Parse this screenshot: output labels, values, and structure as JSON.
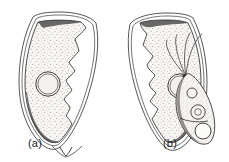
{
  "figure": {
    "kind": "scientific-line-drawing",
    "caption_labels": [
      {
        "id": "a",
        "text": "(a)",
        "x": 28,
        "y": 147
      },
      {
        "id": "b",
        "text": "(b)",
        "x": 163,
        "y": 147
      }
    ],
    "background_color": "#ffffff",
    "ink_color": "#1c1c1c",
    "stipple_color": "#8d8d8d",
    "fill_color": "#f4f3f1",
    "subjects": [
      {
        "id": "a",
        "name": "paired-spores",
        "description": "Two elongate lanceolate spores joined at the base forming a V, each with an outer valve outline, a stippled sporoplasm with a jagged inner margin, and one circular polar capsule.",
        "count": 2,
        "parts": [
          {
            "name": "valve-outline",
            "count": 2
          },
          {
            "name": "sporoplasm",
            "count": 2
          },
          {
            "name": "jagged-inner-margin",
            "count": 2
          },
          {
            "name": "polar-capsule",
            "count": 2
          }
        ]
      },
      {
        "id": "b",
        "name": "flagellated-cell",
        "description": "Small spindle-shaped flagellated cell with four flagella radiating from the apex and three internal circular organelles.",
        "count": 1,
        "parts": [
          {
            "name": "flagellum",
            "count": 4
          },
          {
            "name": "cell-body",
            "count": 1
          },
          {
            "name": "apical-organelle",
            "count": 1
          },
          {
            "name": "nucleus",
            "count": 1
          },
          {
            "name": "posterior-vacuole",
            "count": 1
          }
        ]
      }
    ]
  }
}
